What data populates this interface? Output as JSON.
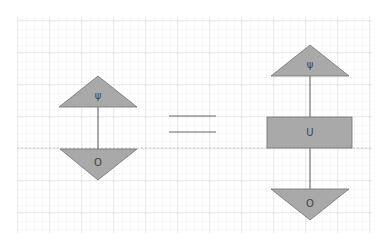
{
  "diagram": {
    "left": {
      "top_triangle_label": "ψ",
      "bottom_triangle_label": "O"
    },
    "equals_sign": "=",
    "right": {
      "top_triangle_label": "ψ",
      "box_label": "U",
      "bottom_triangle_label": "O"
    }
  },
  "colors": {
    "shape_fill": "#a9a9a9",
    "shape_stroke": "#6f6f6f",
    "wire": "#555555",
    "grid_minor": "#ececec",
    "grid_major": "#d8d8d8"
  }
}
